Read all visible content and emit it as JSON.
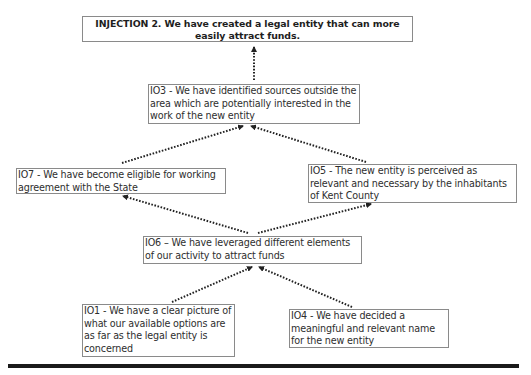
{
  "diagram": {
    "type": "logic tree / prerequisite tree",
    "injection": {
      "id": "INJECTION 2",
      "text": "INJECTION 2. We have created a legal entity that can more easily attract funds."
    },
    "nodes": [
      {
        "id": "IO3",
        "text": "IO3 - We have identified sources outside the area which are potentially interested in the work of the new entity"
      },
      {
        "id": "IO7",
        "text": "IO7 - We have become eligible for working agreement with the State"
      },
      {
        "id": "IO5",
        "text": "IO5 - The new entity is perceived as relevant and necessary by the inhabitants of Kent County"
      },
      {
        "id": "IO6",
        "text": "IO6 – We have leveraged different elements of our activity to attract funds"
      },
      {
        "id": "IO1",
        "text": "IO1 - We have a clear picture of what our available options are as far as the legal entity is concerned"
      },
      {
        "id": "IO4",
        "text": "IO4 - We have decided a meaningful and relevant name for the new entity"
      }
    ],
    "edges": [
      {
        "from": "IO3",
        "to": "INJECTION 2",
        "style": "dotted-arrow"
      },
      {
        "from": "IO7",
        "to": "IO3",
        "style": "dotted-arrow"
      },
      {
        "from": "IO5",
        "to": "IO3",
        "style": "dotted-arrow"
      },
      {
        "from": "IO6",
        "to": "IO7",
        "style": "dotted-arrow"
      },
      {
        "from": "IO6",
        "to": "IO5",
        "style": "dotted-arrow"
      },
      {
        "from": "IO1",
        "to": "IO6",
        "style": "dotted-arrow"
      },
      {
        "from": "IO4",
        "to": "IO6",
        "style": "dotted-arrow"
      }
    ],
    "colors": {
      "text": "#2e2e2e",
      "border": "#8a8a8a",
      "arrow": "#222222",
      "rule": "#1a1a1a"
    }
  }
}
